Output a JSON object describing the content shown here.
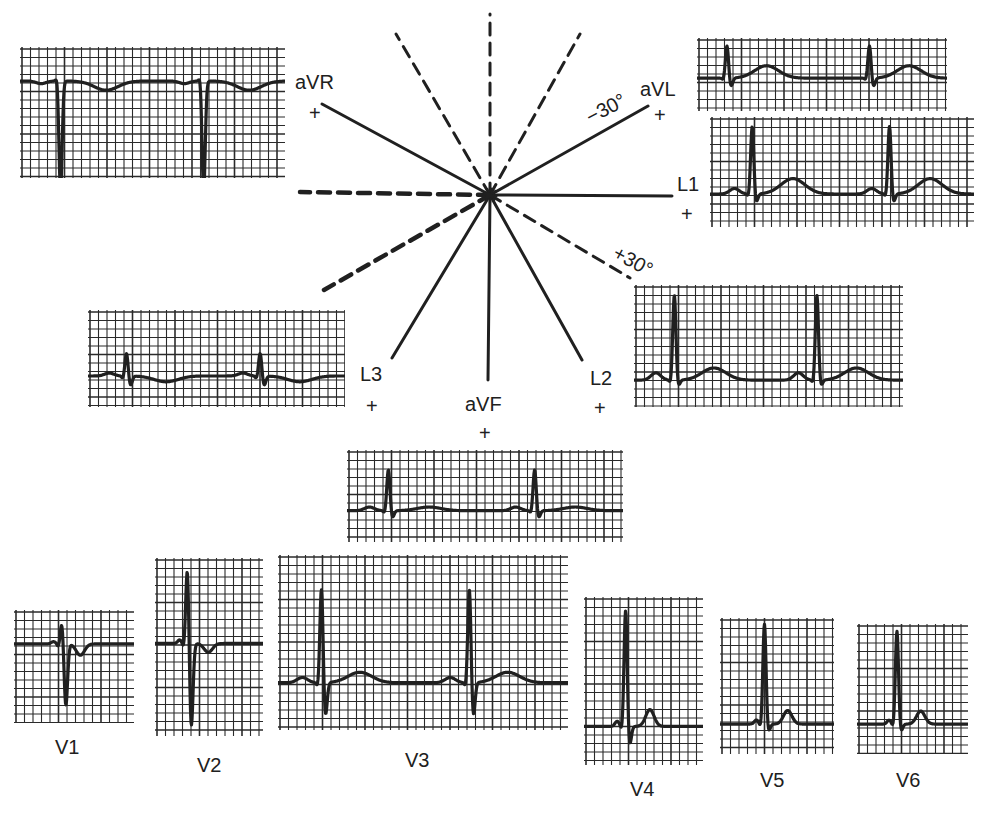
{
  "figure": {
    "colors": {
      "ink": "#202020",
      "grid": "#2a2a2a",
      "paper": "#ffffff"
    }
  },
  "axes": {
    "center": [
      490,
      195
    ],
    "solid": [
      {
        "lead": "aVR",
        "angle_deg": -150,
        "end": [
          322,
          104
        ]
      },
      {
        "lead": "aVL",
        "angle_deg": -30,
        "end": [
          648,
          106
        ]
      },
      {
        "lead": "L1",
        "angle_deg": 0,
        "end": [
          672,
          196
        ]
      },
      {
        "lead": "L2",
        "angle_deg": 60,
        "end": [
          582,
          360
        ]
      },
      {
        "lead": "aVF",
        "angle_deg": 90,
        "end": [
          488,
          380
        ]
      },
      {
        "lead": "L3",
        "angle_deg": 120,
        "end": [
          392,
          358
        ]
      }
    ],
    "dashed": [
      {
        "angle_deg": -120,
        "end": [
          396,
          34
        ]
      },
      {
        "angle_deg": -90,
        "end": [
          490,
          14
        ]
      },
      {
        "angle_deg": -60,
        "end": [
          580,
          34
        ]
      },
      {
        "angle_deg": 180,
        "end": [
          300,
          192
        ]
      },
      {
        "angle_deg": 150,
        "end": [
          324,
          290
        ]
      },
      {
        "angle_deg": 30,
        "end": [
          630,
          278
        ]
      }
    ]
  },
  "labels": {
    "aVR": {
      "text": "aVR",
      "plus": "+"
    },
    "aVL": {
      "text": "aVL",
      "plus": "+"
    },
    "L1": {
      "text": "L1",
      "plus": "+"
    },
    "L2": {
      "text": "L2",
      "plus": "+"
    },
    "L3": {
      "text": "L3",
      "plus": "+"
    },
    "aVF": {
      "text": "aVF",
      "plus": "+"
    },
    "minus30": "−30°",
    "plus30": "+30°"
  },
  "panels": [
    {
      "id": "aVR",
      "x": 20,
      "y": 47,
      "w": 265,
      "h": 131,
      "baseline": 0.26,
      "beats": [
        0.15,
        0.69
      ],
      "polarity": "neg",
      "r": 0.04,
      "s": 0.84,
      "t": -0.07,
      "t_pos": 0.35,
      "p": -0.02
    },
    {
      "id": "aVL",
      "x": 697,
      "y": 38,
      "w": 250,
      "h": 73,
      "baseline": 0.55,
      "beats": [
        0.12,
        0.69
      ],
      "polarity": "pos",
      "r": 0.45,
      "s": -0.12,
      "t": 0.17,
      "t_pos": 0.3,
      "p": 0.0
    },
    {
      "id": "L1",
      "x": 710,
      "y": 117,
      "w": 264,
      "h": 110,
      "baseline": 0.7,
      "beats": [
        0.16,
        0.68
      ],
      "polarity": "pos",
      "r": 0.62,
      "s": -0.08,
      "t": 0.14,
      "t_pos": 0.32,
      "p": 0.05
    },
    {
      "id": "L2",
      "x": 634,
      "y": 285,
      "w": 269,
      "h": 122,
      "baseline": 0.78,
      "beats": [
        0.15,
        0.68
      ],
      "polarity": "pos",
      "r": 0.7,
      "s": -0.05,
      "t": 0.1,
      "t_pos": 0.3,
      "p": 0.06
    },
    {
      "id": "L3",
      "x": 88,
      "y": 310,
      "w": 257,
      "h": 97,
      "baseline": 0.68,
      "beats": [
        0.15,
        0.67
      ],
      "polarity": "pos",
      "r": 0.24,
      "s": -0.1,
      "t": -0.06,
      "t_pos": 0.32,
      "p": 0.03
    },
    {
      "id": "aVF",
      "x": 347,
      "y": 450,
      "w": 276,
      "h": 92,
      "baseline": 0.66,
      "beats": [
        0.15,
        0.68
      ],
      "polarity": "pos",
      "r": 0.45,
      "s": -0.08,
      "t": 0.04,
      "t_pos": 0.3,
      "p": 0.04
    },
    {
      "id": "V1",
      "x": 14,
      "y": 610,
      "w": 120,
      "h": 113,
      "baseline": 0.3,
      "beats": [
        0.4
      ],
      "polarity": "rs",
      "r": 0.2,
      "s": -0.55,
      "t": -0.1,
      "t_pos": 0.3,
      "p": 0.02
    },
    {
      "id": "V2",
      "x": 155,
      "y": 558,
      "w": 108,
      "h": 178,
      "baseline": 0.48,
      "beats": [
        0.3
      ],
      "polarity": "rs",
      "r": 0.44,
      "s": -0.48,
      "t": -0.05,
      "t_pos": 0.38,
      "p": 0.02
    },
    {
      "id": "V3",
      "x": 278,
      "y": 555,
      "w": 290,
      "h": 175,
      "baseline": 0.73,
      "beats": [
        0.15,
        0.66
      ],
      "polarity": "rs",
      "r": 0.55,
      "s": -0.2,
      "t": 0.06,
      "t_pos": 0.28,
      "p": 0.03
    },
    {
      "id": "V4",
      "x": 584,
      "y": 597,
      "w": 119,
      "h": 168,
      "baseline": 0.77,
      "beats": [
        0.35
      ],
      "polarity": "rs",
      "r": 0.7,
      "s": -0.12,
      "t": 0.1,
      "t_pos": 0.4,
      "p": 0.03
    },
    {
      "id": "V5",
      "x": 720,
      "y": 618,
      "w": 114,
      "h": 136,
      "baseline": 0.78,
      "beats": [
        0.39
      ],
      "polarity": "pos",
      "r": 0.74,
      "s": -0.06,
      "t": 0.1,
      "t_pos": 0.4,
      "p": 0.03
    },
    {
      "id": "V6",
      "x": 857,
      "y": 624,
      "w": 111,
      "h": 130,
      "baseline": 0.77,
      "beats": [
        0.36
      ],
      "polarity": "pos",
      "r": 0.72,
      "s": -0.06,
      "t": 0.1,
      "t_pos": 0.42,
      "p": 0.03
    }
  ],
  "precordial_labels": [
    {
      "text": "V1",
      "x": 55,
      "y": 737
    },
    {
      "text": "V2",
      "x": 197,
      "y": 755
    },
    {
      "text": "V3",
      "x": 405,
      "y": 750
    },
    {
      "text": "V4",
      "x": 630,
      "y": 779
    },
    {
      "text": "V5",
      "x": 760,
      "y": 770
    },
    {
      "text": "V6",
      "x": 896,
      "y": 770
    }
  ]
}
